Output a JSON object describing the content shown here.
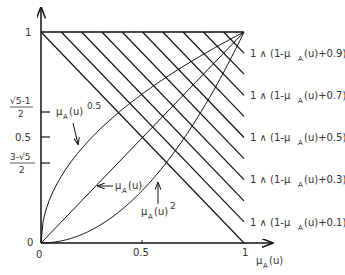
{
  "chart_data": {
    "type": "line",
    "title": "",
    "xlabel": "μA(u)",
    "ylabel": "",
    "xlim": [
      0,
      1
    ],
    "ylim": [
      0,
      1
    ],
    "grid": false,
    "legend": "inline labels",
    "x_ticks": [
      {
        "value": 0,
        "label": "0"
      },
      {
        "value": 0.5,
        "label": "0.5"
      },
      {
        "value": 1,
        "label": "1"
      }
    ],
    "y_ticks": [
      {
        "value": 0,
        "label": "0"
      },
      {
        "value": 0.382,
        "label": "(3-√5)/2"
      },
      {
        "value": 0.5,
        "label": "0.5"
      },
      {
        "value": 0.618,
        "label": "(√5-1)/2"
      },
      {
        "value": 1,
        "label": "1"
      }
    ],
    "series": [
      {
        "name": "μA(u)^0.5",
        "x": [
          0,
          0.1,
          0.25,
          0.5,
          0.75,
          1
        ],
        "y": [
          0,
          0.316,
          0.5,
          0.707,
          0.866,
          1
        ]
      },
      {
        "name": "μA(u)",
        "x": [
          0,
          1
        ],
        "y": [
          0,
          1
        ]
      },
      {
        "name": "μA(u)^2",
        "x": [
          0,
          0.25,
          0.5,
          0.75,
          1
        ],
        "y": [
          0,
          0.0625,
          0.25,
          0.5625,
          1
        ]
      },
      {
        "name": "1 ∧ (1-μA(u)+0.0)",
        "c": 0.0
      },
      {
        "name": "1 ∧ (1-μA(u)+0.1)",
        "c": 0.1
      },
      {
        "name": "1 ∧ (1-μA(u)+0.2)",
        "c": 0.2
      },
      {
        "name": "1 ∧ (1-μA(u)+0.3)",
        "c": 0.3
      },
      {
        "name": "1 ∧ (1-μA(u)+0.4)",
        "c": 0.4
      },
      {
        "name": "1 ∧ (1-μA(u)+0.5)",
        "c": 0.5
      },
      {
        "name": "1 ∧ (1-μA(u)+0.6)",
        "c": 0.6
      },
      {
        "name": "1 ∧ (1-μA(u)+0.7)",
        "c": 0.7
      },
      {
        "name": "1 ∧ (1-μA(u)+0.8)",
        "c": 0.8
      },
      {
        "name": "1 ∧ (1-μA(u)+0.9)",
        "c": 0.9
      }
    ],
    "annotations": [
      {
        "text": "μA(u)^0.5",
        "target_series": 0
      },
      {
        "text": "μA(u)",
        "target_series": 1
      },
      {
        "text": "μA(u)^2",
        "target_series": 2
      },
      {
        "text": "1 ∧ (1-μA(u)+0.9)",
        "at_y": 0.9
      },
      {
        "text": "1 ∧ (1-μA(u)+0.7)",
        "at_y": 0.7
      },
      {
        "text": "1 ∧ (1-μA(u)+0.5)",
        "at_y": 0.5
      },
      {
        "text": "1 ∧ (1-μA(u)+0.3)",
        "at_y": 0.3
      },
      {
        "text": "1 ∧ (1-μA(u)+0.1)",
        "at_y": 0.1
      }
    ]
  },
  "labels": {
    "y_one": "1",
    "y_golden_num": "√5-1",
    "y_golden_den": "2",
    "y_half": "0.5",
    "y_conj_num": "3-√5",
    "y_conj_den": "2",
    "y_zero": "0",
    "x_zero": "0",
    "x_half": "0.5",
    "x_one": "1",
    "x_axis_mu": "μ",
    "x_axis_sub": "A",
    "x_axis_arg": "(u)",
    "sqrt_mu": "μ",
    "sqrt_sub": "A",
    "sqrt_arg": "(u)",
    "sqrt_exp": "0.5",
    "lin_mu": "μ",
    "lin_sub": "A",
    "lin_arg": "(u)",
    "sq_mu": "μ",
    "sq_sub": "A",
    "sq_arg": "(u)",
    "sq_exp": "2",
    "right_prefix": "1 ∧ (1-μ",
    "right_sub": "A",
    "right_09": "(u)+0.9)",
    "right_07": "(u)+0.7)",
    "right_05": "(u)+0.5)",
    "right_03": "(u)+0.3)",
    "right_01": "(u)+0.1)"
  }
}
